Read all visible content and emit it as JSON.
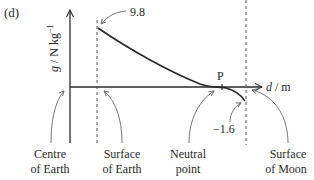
{
  "figure": {
    "part_label": "(d)",
    "y_axis_label": "g / N kg⁻¹",
    "x_axis_label_var": "d",
    "x_axis_label_unit": " / m",
    "point_label": "P",
    "value_surface_earth": "9.8",
    "value_surface_moon": "−1.6",
    "annotations": [
      {
        "line1": "Centre",
        "line2": "of Earth"
      },
      {
        "line1": "Surface",
        "line2": "of Earth"
      },
      {
        "line1": "Neutral",
        "line2": "point"
      },
      {
        "line1": "Surface",
        "line2": "of Moon"
      }
    ],
    "colors": {
      "ink": "#2a2a2a",
      "dashed": "#555555",
      "pointer": "#666666"
    }
  }
}
